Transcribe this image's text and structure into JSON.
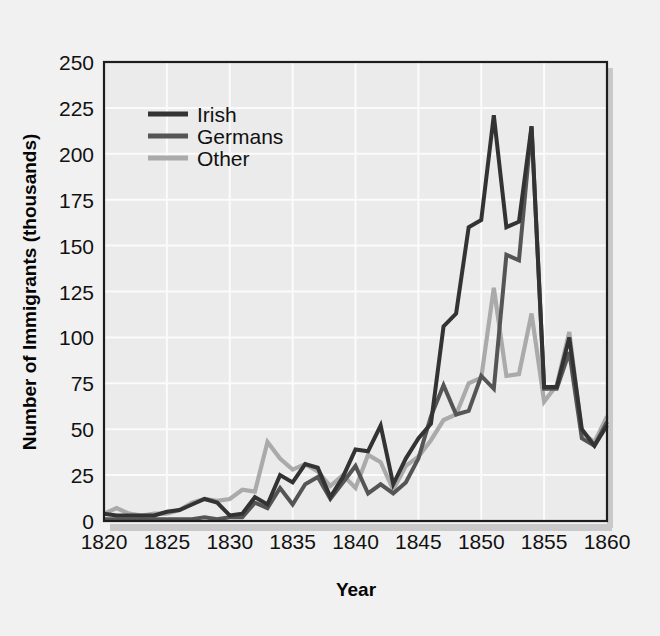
{
  "figure": {
    "background_color": "#f1f1f1",
    "plot_background_color": "#ebebeb",
    "frame_color": "#1d1d1d",
    "grid_color": "#fbfbfb"
  },
  "chart_data": {
    "type": "line",
    "title": "",
    "xlabel": "Year",
    "ylabel": "Number of Immigrants (thousands)",
    "xlim": [
      1820,
      1860
    ],
    "ylim": [
      0,
      250
    ],
    "xticks": [
      1820,
      1825,
      1830,
      1835,
      1840,
      1845,
      1850,
      1855,
      1860
    ],
    "yticks": [
      0,
      25,
      50,
      75,
      100,
      125,
      150,
      175,
      200,
      225,
      250
    ],
    "grid": true,
    "legend_position": "upper-left-inside",
    "x": [
      1820,
      1821,
      1822,
      1823,
      1824,
      1825,
      1826,
      1827,
      1828,
      1829,
      1830,
      1831,
      1832,
      1833,
      1834,
      1835,
      1836,
      1837,
      1838,
      1839,
      1840,
      1841,
      1842,
      1843,
      1844,
      1845,
      1846,
      1847,
      1848,
      1849,
      1850,
      1851,
      1852,
      1853,
      1854,
      1855,
      1856,
      1857,
      1858,
      1859,
      1860
    ],
    "series": [
      {
        "name": "Irish",
        "color": "#333333",
        "values": [
          4,
          3,
          3,
          3,
          3,
          5,
          6,
          9,
          12,
          10,
          3,
          4,
          13,
          9,
          25,
          21,
          31,
          29,
          13,
          24,
          39,
          38,
          52,
          20,
          34,
          45,
          53,
          106,
          113,
          160,
          164,
          221,
          160,
          163,
          215,
          73,
          73,
          100,
          50,
          41,
          52
        ]
      },
      {
        "name": "Germans",
        "color": "#555555",
        "values": [
          1,
          1,
          1,
          1,
          1,
          1,
          1,
          1,
          2,
          1,
          2,
          2,
          10,
          7,
          18,
          9,
          20,
          24,
          12,
          21,
          30,
          15,
          20,
          15,
          21,
          34,
          57,
          74,
          58,
          60,
          79,
          72,
          145,
          142,
          215,
          72,
          72,
          92,
          45,
          41,
          54
        ]
      },
      {
        "name": "Other",
        "color": "#aaaaaa",
        "values": [
          4,
          7,
          4,
          3,
          4,
          4,
          6,
          10,
          12,
          11,
          12,
          17,
          16,
          43,
          34,
          28,
          31,
          27,
          19,
          25,
          18,
          36,
          32,
          17,
          30,
          35,
          44,
          55,
          58,
          75,
          78,
          127,
          79,
          80,
          113,
          65,
          74,
          103,
          48,
          43,
          57
        ]
      }
    ],
    "legend": [
      {
        "label": "Irish",
        "color": "#333333"
      },
      {
        "label": "Germans",
        "color": "#555555"
      },
      {
        "label": "Other",
        "color": "#aaaaaa"
      }
    ]
  }
}
